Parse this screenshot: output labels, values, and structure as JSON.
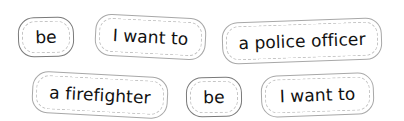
{
  "word_cards": [
    {
      "label": "be",
      "row": 1
    },
    {
      "label": "I want to",
      "row": 1
    },
    {
      "label": "a police officer",
      "row": 1
    },
    {
      "label": "a firefighter",
      "row": 2
    },
    {
      "label": "be",
      "row": 2
    },
    {
      "label": "I want to",
      "row": 2
    }
  ],
  "colors": {
    "card_border": "#a8a8a8",
    "card_border_dark": "#7a7a7a",
    "inner_dashed": "#c4c4c4",
    "text": "#111111",
    "background": "#ffffff"
  }
}
